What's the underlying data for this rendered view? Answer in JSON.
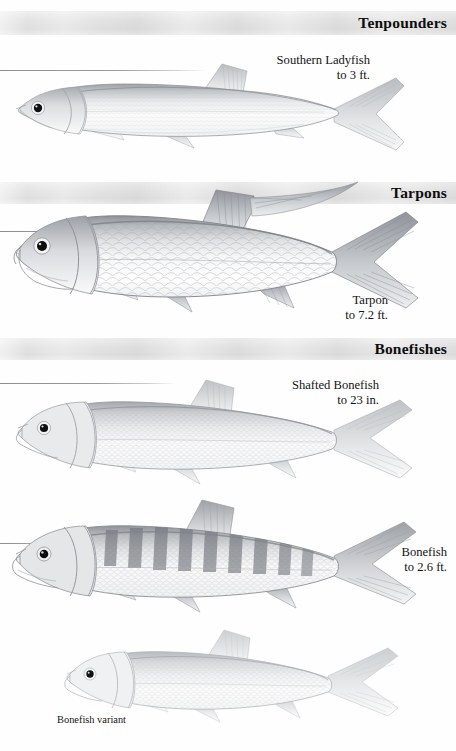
{
  "page": {
    "background_color": "#fefefe",
    "band_color": "#e3e3e3",
    "ink_color": "#131313"
  },
  "sections": [
    {
      "id": "tenpounders",
      "title": "Tenpounders"
    },
    {
      "id": "tarpons",
      "title": "Tarpons"
    },
    {
      "id": "bonefishes",
      "title": "Bonefishes"
    }
  ],
  "species": [
    {
      "id": "southern-ladyfish",
      "name": "Southern Ladyfish",
      "size": "to 3 ft.",
      "section": "Tenpounders"
    },
    {
      "id": "tarpon",
      "name": "Tarpon",
      "size": "to 7.2 ft.",
      "section": "Tarpons"
    },
    {
      "id": "shafted-bonefish",
      "name": "Shafted Bonefish",
      "size": "to 23 in.",
      "section": "Bonefishes"
    },
    {
      "id": "bonefish",
      "name": "Bonefish",
      "size": "to 2.6 ft.",
      "section": "Bonefishes"
    }
  ],
  "caption": {
    "variant": "Bonefish variant"
  }
}
